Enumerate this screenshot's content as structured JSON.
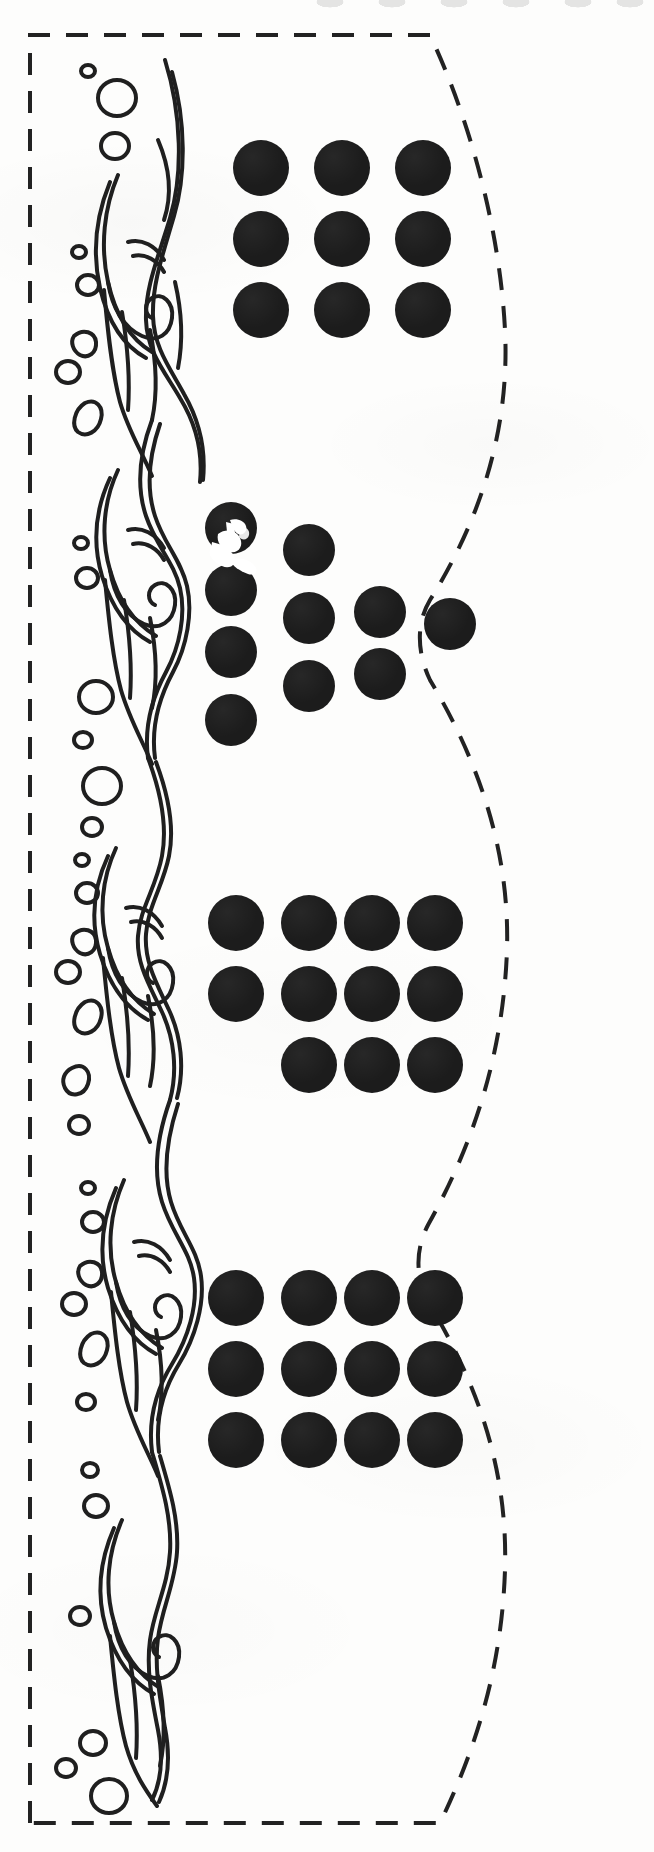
{
  "document": {
    "kind": "craft-cutting-template",
    "title": "Adhesive Dot Sheet Cutting Template",
    "background_color": "#fdfdfc",
    "ink_color": "#1c1c1c",
    "width": 654,
    "height": 1852
  },
  "cut_border": {
    "name": "dashed-cut-line",
    "style": "dashed",
    "stroke_color": "#222222",
    "stroke_width": 4,
    "dash_pattern": "22 16",
    "left_x": 30,
    "top_y": 35,
    "bottom_y": 1823,
    "right_edge_shape": "wavy",
    "right_edge_min_x": 416,
    "right_edge_max_x": 512,
    "wave_count": 3
  },
  "ornament": {
    "name": "wave-flame-scroll-border",
    "description": "Hand-drawn ornamental wave and flame scrollwork with scattered bubble shapes",
    "stroke_color": "#1f1f1f",
    "stroke_width": 4,
    "fill": "none",
    "x": 45,
    "y": 45,
    "width": 160,
    "height": 1770,
    "motif_repeats": 4,
    "bubble_count": 26
  },
  "dot_groups": [
    {
      "name": "dot-group-1",
      "label": "Group 1",
      "layout": "grid",
      "rows": 3,
      "columns": 3,
      "count": 9,
      "dot_diameter": 54,
      "col_spacing": 81,
      "row_spacing": 71,
      "origin_x": 233,
      "origin_y": 140,
      "color": "#1c1c1c",
      "cells": [
        [
          1,
          1,
          1
        ],
        [
          1,
          1,
          1
        ],
        [
          1,
          1,
          1
        ]
      ]
    },
    {
      "name": "dot-group-2",
      "label": "Group 2",
      "layout": "scattered",
      "count": 9,
      "dot_diameter": 50,
      "color": "#1c1c1c",
      "has_scan_artifact": true,
      "artifact_note": "white torn-paper scuff across top-left dot",
      "positions": [
        {
          "x": 205,
          "y": 505
        },
        {
          "x": 205,
          "y": 565
        },
        {
          "x": 205,
          "y": 625
        },
        {
          "x": 205,
          "y": 693
        },
        {
          "x": 283,
          "y": 525
        },
        {
          "x": 283,
          "y": 595
        },
        {
          "x": 283,
          "y": 663
        },
        {
          "x": 355,
          "y": 590
        },
        {
          "x": 355,
          "y": 650
        },
        {
          "x": 425,
          "y": 600
        }
      ]
    },
    {
      "name": "dot-group-3",
      "label": "Group 3",
      "layout": "grid",
      "rows": 3,
      "columns": 4,
      "count": 11,
      "dot_diameter": 54,
      "col_spacing": 73,
      "row_spacing": 71,
      "origin_x": 208,
      "origin_y": 895,
      "color": "#1c1c1c",
      "cells": [
        [
          1,
          1,
          1,
          1
        ],
        [
          1,
          1,
          1,
          1
        ],
        [
          0,
          1,
          1,
          1
        ]
      ]
    },
    {
      "name": "dot-group-4",
      "label": "Group 4",
      "layout": "grid",
      "rows": 3,
      "columns": 4,
      "count": 12,
      "dot_diameter": 54,
      "col_spacing": 73,
      "row_spacing": 71,
      "origin_x": 208,
      "origin_y": 1270,
      "color": "#1c1c1c",
      "cells": [
        [
          1,
          1,
          1,
          1
        ],
        [
          1,
          1,
          1,
          1
        ],
        [
          1,
          1,
          1,
          1
        ]
      ]
    }
  ],
  "totals": {
    "group_count": 4,
    "dot_count_total": 42
  }
}
